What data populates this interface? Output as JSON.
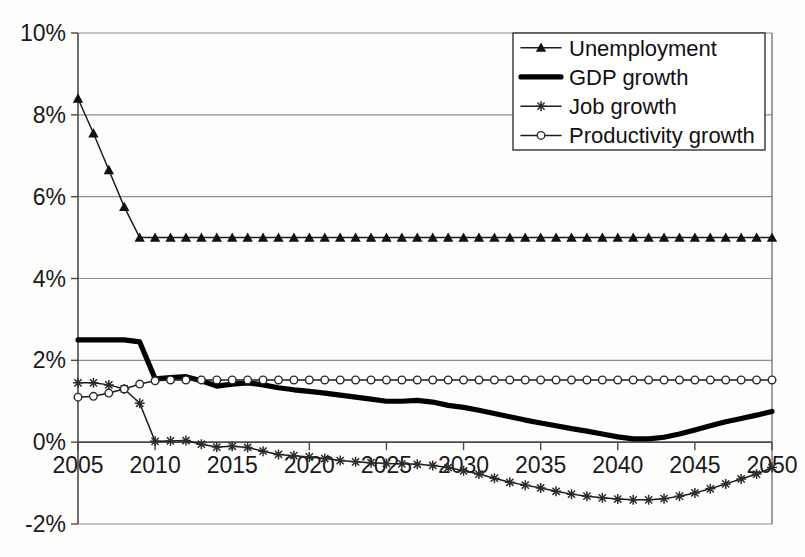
{
  "chart_data": {
    "type": "line",
    "title": "",
    "subtitle": "",
    "xlabel": "",
    "ylabel": "",
    "xlim": [
      2005,
      2050
    ],
    "ylim": [
      -2,
      10
    ],
    "ytick_labels": [
      "10%",
      "8%",
      "6%",
      "4%",
      "2%",
      "0%",
      "-2%"
    ],
    "ytick_values": [
      10,
      8,
      6,
      4,
      2,
      0,
      -2
    ],
    "xtick_labels": [
      "2005",
      "2010",
      "2015",
      "2020",
      "2025",
      "2030",
      "2035",
      "2040",
      "2045",
      "2050"
    ],
    "xtick_values": [
      2005,
      2010,
      2015,
      2020,
      2025,
      2030,
      2035,
      2040,
      2045,
      2050
    ],
    "grid": true,
    "legend_position": "top-right",
    "x": [
      2005,
      2006,
      2007,
      2008,
      2009,
      2010,
      2011,
      2012,
      2013,
      2014,
      2015,
      2016,
      2017,
      2018,
      2019,
      2020,
      2021,
      2022,
      2023,
      2024,
      2025,
      2026,
      2027,
      2028,
      2029,
      2030,
      2031,
      2032,
      2033,
      2034,
      2035,
      2036,
      2037,
      2038,
      2039,
      2040,
      2041,
      2042,
      2043,
      2044,
      2045,
      2046,
      2047,
      2048,
      2049,
      2050
    ],
    "series": [
      {
        "name": "Unemployment",
        "marker": "triangle",
        "line_weight": "thin",
        "values": [
          8.4,
          7.55,
          6.65,
          5.75,
          5.0,
          5.0,
          5.0,
          5.0,
          5.0,
          5.0,
          5.0,
          5.0,
          5.0,
          5.0,
          5.0,
          5.0,
          5.0,
          5.0,
          5.0,
          5.0,
          5.0,
          5.0,
          5.0,
          5.0,
          5.0,
          5.0,
          5.0,
          5.0,
          5.0,
          5.0,
          5.0,
          5.0,
          5.0,
          5.0,
          5.0,
          5.0,
          5.0,
          5.0,
          5.0,
          5.0,
          5.0,
          5.0,
          5.0,
          5.0,
          5.0,
          5.0
        ]
      },
      {
        "name": "GDP growth",
        "marker": "none",
        "line_weight": "thick",
        "values": [
          2.5,
          2.5,
          2.5,
          2.5,
          2.45,
          1.55,
          1.58,
          1.6,
          1.5,
          1.37,
          1.42,
          1.45,
          1.4,
          1.33,
          1.28,
          1.24,
          1.2,
          1.15,
          1.1,
          1.05,
          1.0,
          1.0,
          1.02,
          0.98,
          0.9,
          0.85,
          0.78,
          0.7,
          0.62,
          0.54,
          0.47,
          0.4,
          0.33,
          0.27,
          0.2,
          0.13,
          0.08,
          0.08,
          0.12,
          0.2,
          0.3,
          0.4,
          0.5,
          0.58,
          0.66,
          0.75
        ]
      },
      {
        "name": "Job growth",
        "marker": "star",
        "line_weight": "thin",
        "values": [
          1.45,
          1.45,
          1.4,
          1.3,
          0.95,
          0.02,
          0.03,
          0.04,
          -0.05,
          -0.12,
          -0.1,
          -0.13,
          -0.22,
          -0.3,
          -0.33,
          -0.36,
          -0.4,
          -0.45,
          -0.48,
          -0.5,
          -0.52,
          -0.53,
          -0.54,
          -0.57,
          -0.62,
          -0.7,
          -0.78,
          -0.88,
          -0.98,
          -1.05,
          -1.12,
          -1.2,
          -1.27,
          -1.32,
          -1.36,
          -1.39,
          -1.41,
          -1.41,
          -1.38,
          -1.32,
          -1.24,
          -1.14,
          -1.02,
          -0.9,
          -0.78,
          -0.62
        ]
      },
      {
        "name": "Productivity growth",
        "marker": "circle",
        "line_weight": "thin",
        "values": [
          1.1,
          1.12,
          1.2,
          1.3,
          1.42,
          1.5,
          1.52,
          1.52,
          1.52,
          1.52,
          1.52,
          1.52,
          1.52,
          1.52,
          1.52,
          1.52,
          1.52,
          1.52,
          1.52,
          1.52,
          1.52,
          1.52,
          1.52,
          1.52,
          1.52,
          1.52,
          1.52,
          1.52,
          1.52,
          1.52,
          1.52,
          1.52,
          1.52,
          1.52,
          1.52,
          1.52,
          1.52,
          1.52,
          1.52,
          1.52,
          1.52,
          1.52,
          1.52,
          1.52,
          1.52,
          1.52
        ]
      }
    ]
  },
  "legend": {
    "items": [
      {
        "label": "Unemployment"
      },
      {
        "label": "GDP growth"
      },
      {
        "label": "Job growth"
      },
      {
        "label": "Productivity growth"
      }
    ]
  },
  "colors": {
    "series_ink": "#111111",
    "gridline": "#8e8e8e",
    "background": "#fdfdfc"
  }
}
